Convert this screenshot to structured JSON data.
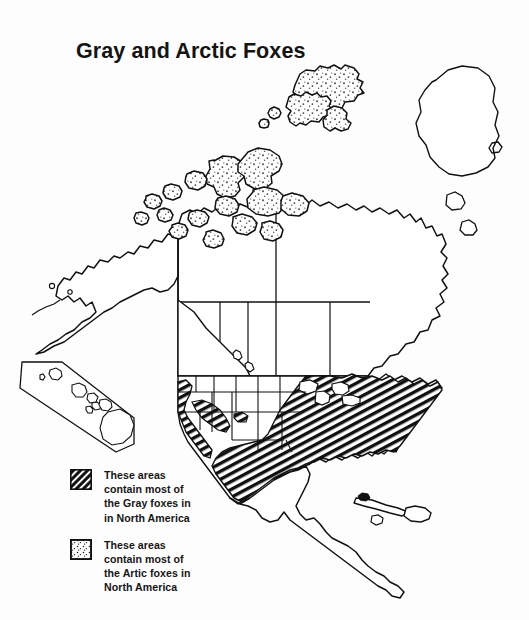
{
  "document": {
    "title": "Gray and Arctic Foxes",
    "background_color": "#fdfdfd",
    "ink_color": "#111111"
  },
  "map": {
    "name": "north-america-fox-range-map",
    "projection_note": "North America with Greenland, Central America and Caribbean",
    "inset": {
      "name": "hawaii-inset",
      "label": ""
    }
  },
  "legend": {
    "items": [
      {
        "swatch": "diagonal-hatch-swatch",
        "swatch_fill": "#111111",
        "text": "These areas\ncontain most of\nthe Gray foxes in\nin North America"
      },
      {
        "swatch": "stipple-dot-swatch",
        "swatch_fill": "#ffffff",
        "text": "These areas\ncontain most of\nthe Artic foxes in\nNorth America"
      }
    ]
  }
}
